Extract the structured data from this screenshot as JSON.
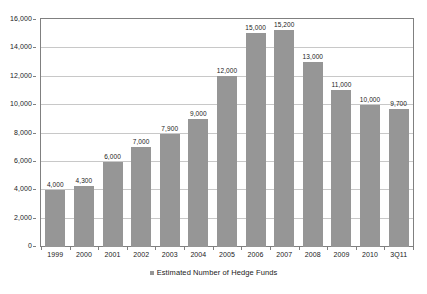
{
  "chart_data": {
    "type": "bar",
    "title": "",
    "subtitle": "",
    "xlabel": "",
    "ylabel": "",
    "categories": [
      "1999",
      "2000",
      "2001",
      "2002",
      "2003",
      "2004",
      "2005",
      "2006",
      "2007",
      "2008",
      "2009",
      "2010",
      "3Q11"
    ],
    "values": [
      4000,
      4300,
      6000,
      7000,
      7900,
      9000,
      12000,
      15000,
      15200,
      13000,
      11000,
      10000,
      9700
    ],
    "data_labels": [
      "4,000",
      "4,300",
      "6,000",
      "7,000",
      "7,900",
      "9,000",
      "12,000",
      "15,000",
      "15,200",
      "13,000",
      "11,000",
      "10,000",
      "9,700"
    ],
    "ylim": [
      0,
      16000
    ],
    "ytick_values": [
      0,
      2000,
      4000,
      6000,
      8000,
      10000,
      12000,
      14000,
      16000
    ],
    "ytick_labels": [
      "0",
      "2,000",
      "4,000",
      "6,000",
      "8,000",
      "10,000",
      "12,000",
      "14,000",
      "16,000"
    ],
    "grid": true,
    "grid_axis": "y",
    "legend": [
      {
        "label": "Estimated Number of Hedge Funds",
        "color": "#969696"
      }
    ],
    "legend_position": "bottom-center",
    "series_color": "#969696",
    "grid_color": "#c8c8c8",
    "axis_color": "#808080",
    "background_color": "#ffffff",
    "text_color": "#1a1a1a"
  }
}
